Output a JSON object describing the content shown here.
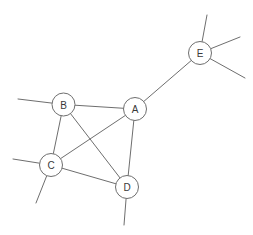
{
  "diagram": {
    "type": "node-link-graph",
    "canvas": {
      "width": 253,
      "height": 235,
      "background": "#ffffff"
    },
    "style": {
      "stroke_color": "#6e6e6e",
      "node_fill": "#ffffff",
      "label_color": "#3a3a3a",
      "stroke_width": 1,
      "node_radius": 11.5,
      "label_font_size": 10
    },
    "nodes": [
      {
        "id": "A",
        "label": "A",
        "x": 135,
        "y": 109,
        "r": 11.5
      },
      {
        "id": "B",
        "label": "B",
        "x": 63.5,
        "y": 104.5,
        "r": 11.5
      },
      {
        "id": "C",
        "label": "C",
        "x": 51,
        "y": 165,
        "r": 11.5
      },
      {
        "id": "D",
        "label": "D",
        "x": 127,
        "y": 187,
        "r": 11.5
      },
      {
        "id": "E",
        "label": "E",
        "x": 200,
        "y": 53,
        "r": 11.5
      }
    ],
    "edges": [
      {
        "id": "edge-b-a",
        "from": "B",
        "to": "A"
      },
      {
        "id": "edge-b-c",
        "from": "B",
        "to": "C"
      },
      {
        "id": "edge-b-d",
        "from": "B",
        "to": "D"
      },
      {
        "id": "edge-c-a",
        "from": "C",
        "to": "A"
      },
      {
        "id": "edge-c-d",
        "from": "C",
        "to": "D"
      },
      {
        "id": "edge-a-d",
        "from": "A",
        "to": "D"
      },
      {
        "id": "edge-a-e",
        "from": "A",
        "to": "E"
      }
    ],
    "stubs": [
      {
        "id": "stub-b-left",
        "from": "B",
        "x2": 18,
        "y2": 99
      },
      {
        "id": "stub-c-left",
        "from": "C",
        "x2": 13,
        "y2": 159
      },
      {
        "id": "stub-c-downleft",
        "from": "C",
        "x2": 36,
        "y2": 203
      },
      {
        "id": "stub-d-down",
        "from": "D",
        "x2": 124,
        "y2": 225
      },
      {
        "id": "stub-e-up",
        "from": "E",
        "x2": 207,
        "y2": 15
      },
      {
        "id": "stub-e-upright",
        "from": "E",
        "x2": 240,
        "y2": 37
      },
      {
        "id": "stub-e-downright",
        "from": "E",
        "x2": 245,
        "y2": 78
      }
    ]
  }
}
